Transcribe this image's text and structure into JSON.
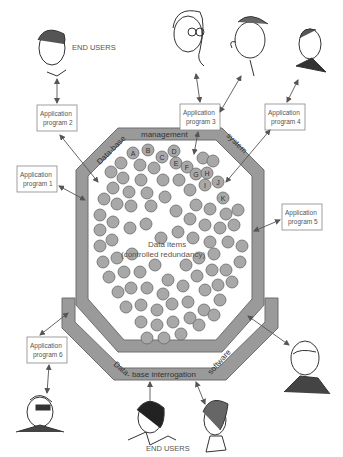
{
  "diagram": {
    "title_top": "END USERS",
    "title_bottom": "END USERS",
    "core": {
      "line1": "Data items",
      "line2": "(controlled redundancy)"
    },
    "band_top": {
      "left": "Data-base",
      "middle": "management",
      "right": "system"
    },
    "band_bottom": {
      "left": "Data",
      "middle": "- base interrogation",
      "right": "software"
    },
    "programs": [
      {
        "line1": "Application",
        "line2": "program 1"
      },
      {
        "line1": "Application",
        "line2": "program 2"
      },
      {
        "line1": "Application",
        "line2": "program 3"
      },
      {
        "line1": "Application",
        "line2": "program 4"
      },
      {
        "line1": "Application",
        "line2": "program 5"
      },
      {
        "line1": "Application",
        "line2": "program 6"
      }
    ],
    "lettered_items": [
      "A",
      "B",
      "C",
      "D",
      "E",
      "F",
      "G",
      "H",
      "I",
      "J",
      "K"
    ],
    "colors": {
      "band": "#9a9a9a",
      "band_edge": "#6e6e6e",
      "circle_fill": "#a8a8a8",
      "circle_edge": "#6a6a6a",
      "arrow": "#555555"
    },
    "users": [
      {
        "position": "top-left"
      },
      {
        "position": "top-center-left"
      },
      {
        "position": "top-center-right"
      },
      {
        "position": "top-right"
      },
      {
        "position": "bottom-left"
      },
      {
        "position": "bottom-center-left"
      },
      {
        "position": "bottom-center-right"
      },
      {
        "position": "bottom-right"
      }
    ]
  }
}
